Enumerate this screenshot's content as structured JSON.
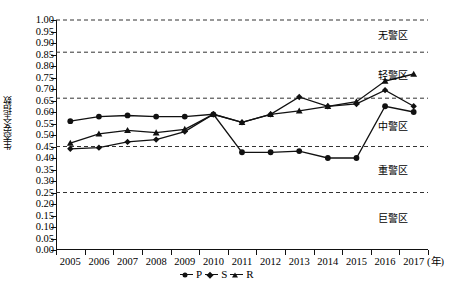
{
  "chart_data": {
    "type": "line",
    "title": "",
    "xlabel": "年",
    "ylabel": "生态安全指数",
    "x": [
      2005,
      2006,
      2007,
      2008,
      2009,
      2010,
      2011,
      2012,
      2013,
      2014,
      2015,
      2016,
      2017
    ],
    "categories": [
      "2005",
      "2006",
      "2007",
      "2008",
      "2009",
      "2010",
      "2011",
      "2012",
      "2013",
      "2014",
      "2015",
      "2016",
      "2017"
    ],
    "ylim": [
      0.0,
      1.0
    ],
    "ytick_labels": [
      "0.00",
      "0.05",
      "0.10",
      "0.15",
      "0.20",
      "0.25",
      "0.30",
      "0.35",
      "0.40",
      "0.45",
      "0.50",
      "0.55",
      "0.60",
      "0.65",
      "0.70",
      "0.75",
      "0.80",
      "0.85",
      "0.90",
      "0.95",
      "1.00"
    ],
    "ytick_values": [
      0.0,
      0.05,
      0.1,
      0.15,
      0.2,
      0.25,
      0.3,
      0.35,
      0.4,
      0.45,
      0.5,
      0.55,
      0.6,
      0.65,
      0.7,
      0.75,
      0.8,
      0.85,
      0.9,
      0.95,
      1.0
    ],
    "grid": false,
    "legend_position": "bottom-center",
    "series": [
      {
        "name": "P",
        "marker": "circle",
        "values": [
          0.56,
          0.58,
          0.585,
          0.58,
          0.58,
          0.59,
          0.425,
          0.425,
          0.43,
          0.4,
          0.4,
          0.625,
          0.6
        ]
      },
      {
        "name": "S",
        "marker": "diamond",
        "values": [
          0.44,
          0.445,
          0.47,
          0.48,
          0.515,
          0.59,
          0.555,
          0.59,
          0.665,
          0.625,
          0.635,
          0.695,
          0.625
        ]
      },
      {
        "name": "R",
        "marker": "triangle",
        "values": [
          0.465,
          0.505,
          0.52,
          0.51,
          0.525,
          0.59,
          0.555,
          0.59,
          0.605,
          0.625,
          0.645,
          0.735,
          0.765
        ]
      }
    ],
    "threshold_lines": [
      {
        "value": 1.0,
        "style": "dashed"
      },
      {
        "value": 0.86,
        "style": "dashed"
      },
      {
        "value": 0.66,
        "style": "dashed"
      },
      {
        "value": 0.45,
        "style": "dashed"
      },
      {
        "value": 0.25,
        "style": "dashed"
      }
    ],
    "zone_labels": [
      {
        "text": "无警区",
        "value": 0.93
      },
      {
        "text": "轻警区",
        "value": 0.755
      },
      {
        "text": "中警区",
        "value": 0.535
      },
      {
        "text": "重警区",
        "value": 0.345
      },
      {
        "text": "巨警区",
        "value": 0.135
      }
    ],
    "legend": [
      {
        "label": "P",
        "marker": "circle"
      },
      {
        "label": "S",
        "marker": "diamond"
      },
      {
        "label": "R",
        "marker": "triangle"
      }
    ],
    "colors": {
      "line": "#111111",
      "marker": "#111111",
      "axis": "#111111",
      "threshold": "#333333"
    }
  }
}
